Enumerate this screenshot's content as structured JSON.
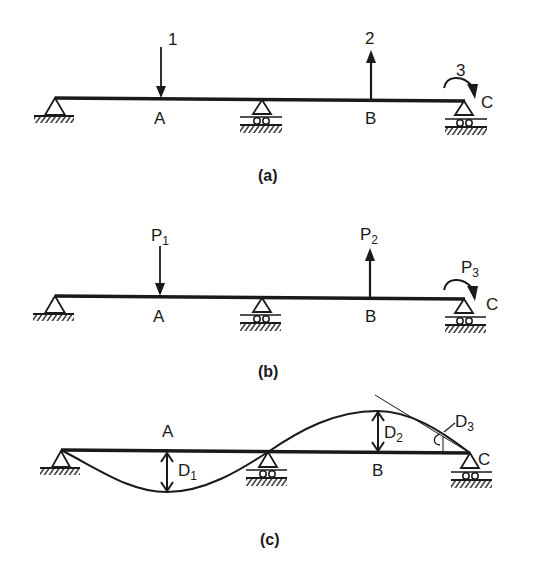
{
  "figure": {
    "panels": [
      {
        "id": "a",
        "caption": "(a)",
        "points": {
          "A": "A",
          "B": "B",
          "C": "C"
        },
        "loads": [
          {
            "label": "1",
            "sub": "",
            "type": "force-down",
            "at": "A"
          },
          {
            "label": "2",
            "sub": "",
            "type": "force-up",
            "at": "B"
          },
          {
            "label": "3",
            "sub": "",
            "type": "moment-clockwise",
            "at": "C"
          }
        ]
      },
      {
        "id": "b",
        "caption": "(b)",
        "points": {
          "A": "A",
          "B": "B",
          "C": "C"
        },
        "loads": [
          {
            "label": "P",
            "sub": "1",
            "type": "force-down",
            "at": "A"
          },
          {
            "label": "P",
            "sub": "2",
            "type": "force-up",
            "at": "B"
          },
          {
            "label": "P",
            "sub": "3",
            "type": "moment-clockwise",
            "at": "C"
          }
        ]
      },
      {
        "id": "c",
        "caption": "(c)",
        "points": {
          "A": "A",
          "B": "B",
          "C": "C"
        },
        "displacements": [
          {
            "label": "D",
            "sub": "1",
            "at": "A"
          },
          {
            "label": "D",
            "sub": "2",
            "at": "B"
          },
          {
            "label": "D",
            "sub": "3",
            "at": "C",
            "type": "rotation"
          }
        ]
      }
    ],
    "supports": [
      "pin",
      "roller",
      "roller"
    ],
    "colors": {
      "ink": "#1a1a1a",
      "background": "#ffffff"
    }
  }
}
